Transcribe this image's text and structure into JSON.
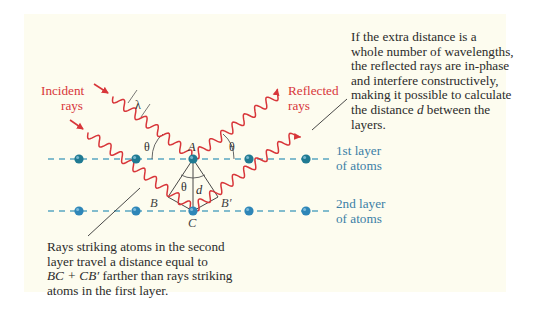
{
  "colors": {
    "panel_background": "#fdfcef",
    "ray": "#d8363a",
    "layer_line": "#5aa6c2",
    "atom": "#2e86b8",
    "atom_top_layer": "#1f7a92",
    "label_blue": "#3b7fa6",
    "text": "#2b2b2b",
    "construction_line": "#333333"
  },
  "labels": {
    "incident": [
      "Incident",
      "rays"
    ],
    "reflected": [
      "Reflected",
      "rays"
    ],
    "layer1": [
      "1st layer",
      "of atoms"
    ],
    "layer2": [
      "2nd layer",
      "of atoms"
    ],
    "wavelength": "λ",
    "theta": "θ",
    "point_A": "A",
    "point_B": "B",
    "point_B_prime": "B′",
    "point_C": "C",
    "distance_d": "d"
  },
  "annotations": {
    "top_right": {
      "lines": [
        "If the extra distance is a",
        "whole number of wavelengths,",
        "the reflected rays are in-phase",
        "and interfere constructively,",
        "making it possible to calculate",
        "the distance ",
        "layers."
      ],
      "line6_italic": "d",
      "line6_tail": " between the"
    },
    "bottom_left": {
      "lines": [
        "Rays striking atoms in the second",
        "layer travel a distance equal to",
        " farther than rays striking",
        "atoms in the first layer."
      ],
      "line3_expr": "BC + CB′"
    }
  },
  "layers": [
    {
      "name": "1st layer",
      "y": 159,
      "atoms_x": [
        79,
        136,
        193,
        249,
        306
      ]
    },
    {
      "name": "2nd layer",
      "y": 211,
      "atoms_x": [
        79,
        136,
        193,
        249,
        306
      ]
    }
  ]
}
